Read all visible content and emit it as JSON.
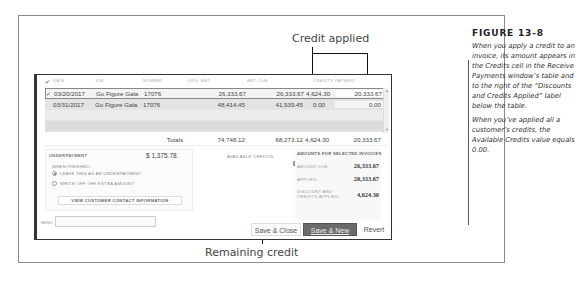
{
  "callouts": {
    "top": "Credit applied",
    "bottom": "Remaining credit"
  },
  "caption": {
    "title": "FIGURE 13-8",
    "paragraphs": [
      "When you apply a credit to an invoice, its amount appears in the Credits cell in the Receive Payments window’s table and to the right of the “Discounts and Credits Applied” label below the table.",
      "When you’ve applied all a customer’s credits, the Available Credits value equals 0.00."
    ]
  },
  "table": {
    "headers": {
      "check": "✓",
      "date": "DATE",
      "job": "JOB",
      "number": "NUMBER",
      "orig_amt": "ORIG. AMT.",
      "amt_due": "AMT. DUE",
      "credits": "CREDITS",
      "payment": "PAYMENT"
    },
    "rows": [
      {
        "checked": "✓",
        "date": "03/20/2017",
        "job": "Go Figure Gala",
        "number": "17076",
        "orig_amt": "26,333.67",
        "amt_due": "26,333.67",
        "credits": "4,624.30",
        "payment": "20,333.67"
      },
      {
        "checked": "",
        "date": "03/31/2017",
        "job": "Go Figure Gala",
        "number": "17076",
        "orig_amt": "48,414.45",
        "amt_due": "41,939.45",
        "credits": "0.00",
        "payment": "0.00"
      }
    ],
    "totals": {
      "label": "Totals",
      "orig_amt": "74,748.12",
      "amt_due": "68,273.12",
      "credits": "4,624.30",
      "payment": "20,333.67"
    }
  },
  "underpayment": {
    "title": "UNDERPAYMENT",
    "amount": "$ 1,375.78.",
    "when_finished": "WHEN FINISHED:",
    "options": [
      {
        "label": "LEAVE THIS AS AN UNDERPAYMENT",
        "selected": true
      },
      {
        "label": "WRITE OFF THE EXTRA AMOUNT",
        "selected": false
      }
    ],
    "contact_button": "VIEW CUSTOMER CONTACT INFORMATION"
  },
  "available_credits": {
    "label": "AVAILABLE CREDITS",
    "value": "0.00"
  },
  "amounts": {
    "title": "AMOUNTS FOR SELECTED INVOICES",
    "amount_due_label": "AMOUNT DUE",
    "amount_due": "26,333.67",
    "applied_label": "APPLIED",
    "applied": "20,333.67",
    "discount_label": "DISCOUNT AND CREDITS APPLIED",
    "discount": "4,624.30"
  },
  "memo": {
    "label": "MEMO",
    "value": ""
  },
  "buttons": {
    "save_close": "Save & Close",
    "save_new": "Save & New",
    "revert": "Revert"
  }
}
